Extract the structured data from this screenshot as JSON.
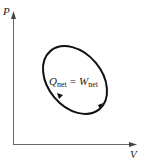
{
  "diagram": {
    "type": "pv-cycle",
    "axes": {
      "y_label": "P",
      "x_label": "V"
    },
    "cycle": {
      "shape": "closed-ellipse",
      "direction": "clockwise",
      "equation": {
        "lhs_symbol": "Q",
        "lhs_sub": "net",
        "equals": "=",
        "rhs_symbol": "W",
        "rhs_sub": "net"
      }
    },
    "colors": {
      "axis": "#555555",
      "cycle": "#111111",
      "text": "#222222"
    }
  }
}
